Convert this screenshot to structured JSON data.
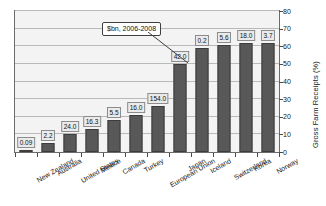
{
  "chart_data": {
    "type": "bar",
    "title": "",
    "xlabel": "",
    "ylabel": "Gross Farm Receipts (%)",
    "ylim": [
      0,
      80
    ],
    "yticks": [
      0,
      10,
      20,
      30,
      40,
      50,
      60,
      70,
      80
    ],
    "grid": true,
    "legend": null,
    "categories": [
      "New Zealand",
      "Australia",
      "United States",
      "Mexico",
      "Canada",
      "Turkey",
      "European Union",
      "Japan",
      "Iceland",
      "Switzerland",
      "Korea",
      "Norway"
    ],
    "values": [
      1.0,
      5.0,
      10.0,
      13.0,
      18.0,
      21.0,
      26.0,
      50.0,
      59.0,
      61.0,
      62.0,
      62.0
    ],
    "data_labels": [
      "0.09",
      "2.2",
      "24.0",
      "16.3",
      "5.5",
      "16.0",
      "154.0",
      "42.0",
      "0.2",
      "5.6",
      "18.0",
      "3.7"
    ],
    "annotations": [
      {
        "text": "$bn, 2006-2008",
        "points_to": "Japan"
      }
    ],
    "colors": {
      "bar_fill": "#585858",
      "bar_border": "#3d3d3d",
      "plot_background": "#f3f3f3",
      "gridline": "#b9b9b9",
      "axis": "#6b6b6b",
      "label_box_fill": "#eaeaea",
      "label_box_border": "#8c8c8c",
      "text": "#141414",
      "page_background": "#ffffff"
    }
  }
}
